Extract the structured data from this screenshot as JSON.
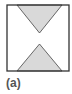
{
  "figure": {
    "label": "(a)",
    "frame_color": "#333333",
    "fill_color": "#d9d9d9",
    "shapes": [
      "square-frame",
      "inverted-triangle-top",
      "triangle-bottom"
    ]
  }
}
